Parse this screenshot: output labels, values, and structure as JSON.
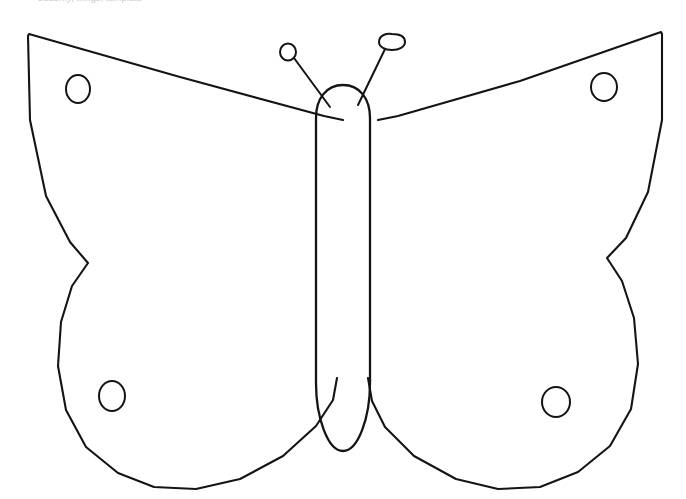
{
  "page": {
    "width": 686,
    "height": 499,
    "background_color": "#ffffff",
    "ink_color": "#141414",
    "header_text": "butterfly, wings, template",
    "header_text_color": "#c9c9cf"
  },
  "artwork": {
    "subject": "butterfly",
    "style": "black and white line art outline, coloring page / cut-out template",
    "fill": "none",
    "symmetry": "bilateral, vertical axis",
    "parts": {
      "body": {
        "label": "Body",
        "shape": "elongated rounded capsule",
        "center_x": 343,
        "top_y": 85,
        "bottom_y": 452,
        "width": 46
      },
      "left_wing": {
        "label": "Left wing",
        "spots": 2
      },
      "right_wing": {
        "label": "Right wing",
        "spots": 2
      },
      "antennae": {
        "label": "Antennae",
        "count": 2,
        "tip": "club / knob"
      },
      "spots": {
        "label": "Wing spots",
        "count": 4,
        "shape": "small oval outline"
      }
    },
    "paths": {
      "left_wing": "M 343 120 L 324 116 L 180 77 L 29 34 L 28 36 L 30 120 L 46 196 L 70 242 L 88 263 L 72 286 L 61 322 L 58 366 L 66 410 L 86 447 L 118 473 L 154 487 L 196 489 L 240 479 L 283 456 L 316 426 L 333 400 L 337 378",
      "right_wing": "M 378 120 L 398 116 L 520 81 L 661 32 L 662 34 L 662 120 L 648 192 L 626 238 L 607 258 L 622 281 L 634 318 L 638 364 L 631 409 L 610 446 L 578 472 L 540 487 L 498 489 L 456 479 L 414 456 L 385 427 L 372 401 L 368 378",
      "body": "M 343 85 C 326 85 316 99 316 118 L 316 383 C 316 418 328 451 343 451 C 358 451 370 418 370 383 L 370 118 C 370 99 360 85 343 85 Z",
      "left_antenna_stalk": "M 294 58 L 330 107",
      "right_antenna_stalk": "M 386 47 L 358 105",
      "left_antenna_knob": "M 288 52 m -8 0 a 8 8.5 0 1 0 16 0 a 8 8.5 0 1 0 -16 0",
      "right_antenna_knob": "M 379 42 C 379 35 387 33 392 34 C 401 34 405 37 405 42 C 405 47 399 50 392 50 C 385 50 379 47 379 42 Z"
    },
    "spot_positions": [
      {
        "name": "upper-left-spot",
        "cx": 78,
        "cy": 89,
        "rx": 12,
        "ry": 14
      },
      {
        "name": "upper-right-spot",
        "cx": 604,
        "cy": 87,
        "rx": 13,
        "ry": 14
      },
      {
        "name": "lower-left-spot",
        "cx": 112,
        "cy": 396,
        "rx": 13,
        "ry": 15
      },
      {
        "name": "lower-right-spot",
        "cx": 556,
        "cy": 402,
        "rx": 14,
        "ry": 15
      }
    ]
  }
}
